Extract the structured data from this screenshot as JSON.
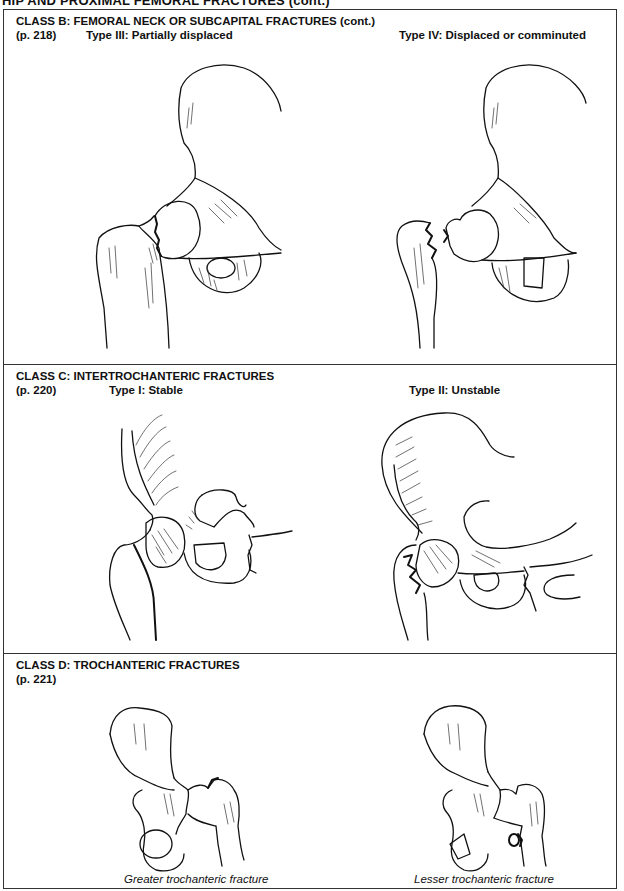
{
  "running_head": "HIP AND PROXIMAL FEMORAL FRACTURES (cont.)",
  "panels": [
    {
      "class_title": "CLASS B: FEMORAL NECK OR SUBCAPITAL FRACTURES (cont.)",
      "page_ref": "(p. 218)",
      "figures": [
        {
          "label": "Type III: Partially displaced",
          "illustration": "hip-femoral-neck-partially-displaced"
        },
        {
          "label": "Type IV: Displaced or comminuted",
          "illustration": "hip-femoral-neck-displaced-comminuted"
        }
      ]
    },
    {
      "class_title": "CLASS C: INTERTROCHANTERIC FRACTURES",
      "page_ref": "(p. 220)",
      "figures": [
        {
          "label": "Type I: Stable",
          "illustration": "hip-intertrochanteric-stable"
        },
        {
          "label": "Type II: Unstable",
          "illustration": "hip-intertrochanteric-unstable"
        }
      ]
    },
    {
      "class_title": "CLASS D: TROCHANTERIC FRACTURES",
      "page_ref": "(p. 221)",
      "figures": [
        {
          "caption": "Greater trochanteric fracture",
          "illustration": "hip-greater-trochanteric-fracture"
        },
        {
          "caption": "Lesser trochanteric fracture",
          "illustration": "hip-lesser-trochanteric-fracture"
        }
      ]
    }
  ]
}
